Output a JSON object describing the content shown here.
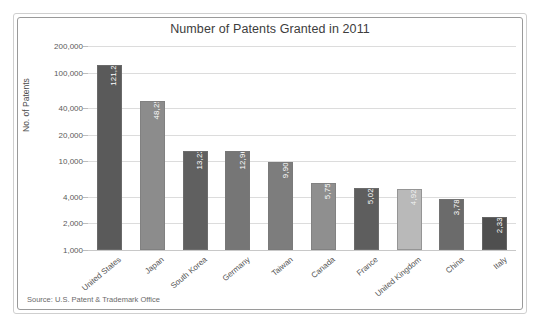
{
  "frame": {
    "outer_border_color": "#cfcfcf",
    "inner_border_color": "#9a9a9a",
    "background": "#ffffff"
  },
  "source_note": "Source: U.S. Patent & Trademark Office",
  "chart_data": {
    "type": "bar",
    "title": "Number of Patents Granted in 2011",
    "xlabel": "",
    "ylabel": "No. of Patents",
    "yscale": "log",
    "ylim": [
      1000,
      200000
    ],
    "grid": true,
    "legend": "none",
    "ytick_labels": [
      "200,000",
      "100,000",
      "40,000",
      "20,000",
      "10,000",
      "4,000",
      "2,000",
      "1,000"
    ],
    "ytick_values": [
      200000,
      100000,
      40000,
      20000,
      10000,
      4000,
      2000,
      1000
    ],
    "categories": [
      "United States",
      "Japan",
      "South Korea",
      "Germany",
      "Taiwan",
      "Canada",
      "France",
      "United Kingdom",
      "China",
      "Italy"
    ],
    "values": [
      121261,
      48256,
      13239,
      12968,
      9907,
      5754,
      5022,
      4924,
      3785,
      2333
    ],
    "value_labels": [
      "121,261",
      "48,256",
      "13,239",
      "12,968",
      "9,907",
      "5,754",
      "5,022",
      "4,924",
      "3,785",
      "2,333"
    ],
    "bar_colors": [
      "#5a5a5a",
      "#8c8c8c",
      "#606060",
      "#767676",
      "#7d7d7d",
      "#8f8f8f",
      "#5e5e5e",
      "#b9b9b9",
      "#6b6b6b",
      "#4f4f4f"
    ]
  }
}
